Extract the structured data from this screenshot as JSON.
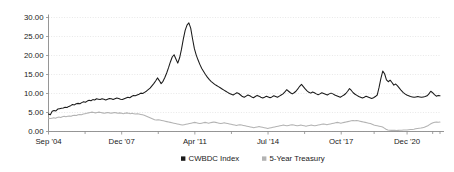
{
  "chart_data": {
    "type": "line",
    "title": "",
    "subtitle": "",
    "xlabel": "",
    "ylabel": "",
    "ylim": [
      0,
      30
    ],
    "yticks": [
      0,
      5,
      10,
      15,
      20,
      25,
      30
    ],
    "ytick_labels": [
      "0.00",
      "5.00",
      "10.00",
      "15.00",
      "20.00",
      "25.00",
      "30.00"
    ],
    "xtick_labels": [
      "Sep '04",
      "Dec '07",
      "Apr '11",
      "Jul '14",
      "Oct '17",
      "Dec '20"
    ],
    "xtick_positions": [
      0,
      40,
      80,
      120,
      160,
      196
    ],
    "x_index_range": [
      0,
      214
    ],
    "grid": true,
    "grid_color": "#d9d9d9",
    "legend_position": "bottom",
    "legend": [
      {
        "name": "CWBDC Index",
        "marker": "square",
        "color": "#1a1a1a"
      },
      {
        "name": "5-Year Treasury",
        "marker": "square",
        "color": "#b3b3b3"
      }
    ],
    "series": [
      {
        "name": "CWBDC Index",
        "color": "#1a1a1a",
        "width": 1.05,
        "values": [
          4.6,
          4.4,
          5.3,
          5.5,
          5.4,
          5.9,
          6.0,
          6.1,
          6.2,
          6.4,
          6.3,
          6.6,
          6.8,
          7.1,
          7.0,
          7.3,
          7.4,
          7.3,
          7.6,
          7.8,
          7.7,
          8.0,
          8.2,
          8.1,
          8.4,
          8.3,
          8.6,
          8.5,
          8.4,
          8.6,
          8.5,
          8.3,
          8.5,
          8.7,
          8.6,
          8.4,
          8.6,
          8.8,
          8.7,
          8.5,
          8.4,
          8.6,
          8.8,
          9.0,
          8.9,
          9.2,
          9.5,
          9.4,
          9.6,
          9.8,
          10.1,
          10.0,
          10.3,
          10.6,
          11.0,
          11.4,
          12.0,
          12.6,
          13.3,
          14.1,
          13.4,
          12.6,
          13.2,
          14.2,
          15.4,
          16.8,
          18.3,
          19.6,
          20.2,
          19.1,
          18.0,
          19.4,
          21.6,
          24.3,
          26.6,
          28.0,
          28.6,
          27.2,
          24.4,
          21.8,
          20.1,
          18.8,
          17.6,
          16.6,
          15.8,
          15.0,
          14.3,
          13.7,
          13.2,
          12.8,
          12.4,
          12.1,
          11.8,
          11.5,
          11.2,
          10.9,
          10.6,
          10.3,
          10.0,
          9.8,
          9.6,
          9.9,
          10.2,
          10.0,
          9.6,
          9.2,
          9.0,
          9.3,
          9.6,
          9.4,
          9.1,
          8.9,
          9.2,
          9.5,
          9.3,
          9.0,
          8.8,
          9.0,
          9.3,
          9.1,
          8.9,
          9.1,
          9.4,
          9.2,
          9.0,
          9.3,
          9.6,
          9.9,
          10.4,
          11.0,
          10.6,
          10.2,
          9.9,
          10.2,
          10.6,
          11.2,
          11.9,
          12.4,
          11.8,
          11.2,
          10.7,
          10.3,
          10.1,
          10.4,
          10.2,
          9.9,
          9.7,
          9.9,
          10.2,
          10.0,
          9.8,
          9.6,
          9.9,
          10.1,
          9.9,
          9.6,
          9.4,
          9.2,
          9.0,
          9.3,
          9.6,
          10.0,
          10.6,
          11.3,
          10.8,
          10.2,
          9.8,
          9.5,
          9.2,
          9.0,
          8.8,
          9.0,
          9.3,
          9.1,
          8.9,
          8.7,
          8.9,
          9.2,
          9.6,
          11.6,
          14.0,
          15.9,
          15.2,
          13.6,
          13.1,
          13.5,
          12.9,
          12.2,
          12.5,
          12.0,
          11.4,
          10.8,
          10.3,
          9.9,
          9.6,
          9.4,
          9.2,
          9.1,
          9.0,
          9.1,
          9.2,
          9.1,
          9.0,
          9.1,
          9.2,
          9.4,
          9.9,
          10.6,
          10.2,
          9.7,
          9.3,
          9.5,
          9.4
        ]
      },
      {
        "name": "5-Year Treasury",
        "color": "#b3b3b3",
        "width": 1.05,
        "values": [
          3.5,
          3.4,
          3.5,
          3.6,
          3.5,
          3.7,
          3.8,
          3.7,
          3.9,
          4.0,
          3.9,
          4.0,
          4.1,
          4.0,
          4.2,
          4.3,
          4.2,
          4.4,
          4.5,
          4.4,
          4.6,
          4.7,
          4.8,
          4.9,
          5.0,
          5.1,
          5.0,
          4.9,
          5.0,
          5.1,
          5.0,
          4.9,
          4.8,
          4.9,
          5.0,
          4.9,
          4.8,
          4.9,
          5.0,
          4.9,
          4.8,
          4.9,
          4.8,
          4.7,
          4.8,
          4.9,
          4.8,
          4.7,
          4.8,
          4.7,
          4.6,
          4.7,
          4.6,
          4.5,
          4.4,
          4.3,
          4.1,
          3.9,
          3.7,
          3.5,
          3.3,
          3.1,
          3.0,
          3.1,
          3.0,
          2.9,
          2.8,
          2.7,
          2.6,
          2.5,
          2.4,
          2.3,
          2.2,
          2.1,
          2.0,
          1.9,
          1.8,
          1.7,
          1.8,
          1.9,
          2.0,
          2.1,
          2.2,
          2.3,
          2.4,
          2.3,
          2.2,
          2.1,
          2.2,
          2.3,
          2.4,
          2.3,
          2.2,
          2.3,
          2.4,
          2.5,
          2.4,
          2.3,
          2.2,
          2.1,
          2.2,
          2.3,
          2.2,
          2.1,
          2.0,
          1.9,
          1.8,
          1.7,
          1.6,
          1.7,
          1.8,
          1.7,
          1.6,
          1.5,
          1.4,
          1.3,
          1.2,
          1.1,
          1.0,
          1.1,
          1.2,
          1.3,
          1.2,
          1.1,
          1.0,
          0.9,
          0.8,
          0.9,
          1.0,
          1.1,
          1.2,
          1.3,
          1.4,
          1.5,
          1.6,
          1.7,
          1.6,
          1.5,
          1.6,
          1.7,
          1.8,
          1.7,
          1.6,
          1.5,
          1.6,
          1.7,
          1.6,
          1.5,
          1.4,
          1.5,
          1.6,
          1.7,
          1.6,
          1.5,
          1.6,
          1.7,
          1.8,
          1.9,
          2.0,
          1.9,
          1.8,
          1.9,
          2.0,
          2.1,
          2.2,
          2.3,
          2.4,
          2.3,
          2.2,
          2.3,
          2.4,
          2.5,
          2.6,
          2.7,
          2.8,
          2.9,
          2.8,
          2.9,
          2.8,
          2.7,
          2.6,
          2.5,
          2.4,
          2.3,
          2.2,
          2.1,
          1.9,
          1.7,
          1.6,
          1.5,
          1.4,
          1.3,
          1.2,
          0.9,
          0.6,
          0.4,
          0.35,
          0.3,
          0.32,
          0.3,
          0.28,
          0.3,
          0.32,
          0.35,
          0.4,
          0.38,
          0.4,
          0.45,
          0.5,
          0.55,
          0.6,
          0.7,
          0.8,
          0.85,
          0.9,
          1.0,
          1.1,
          1.3,
          1.5,
          1.8,
          2.1,
          2.3,
          2.45,
          2.5,
          2.45,
          2.5
        ]
      }
    ]
  }
}
